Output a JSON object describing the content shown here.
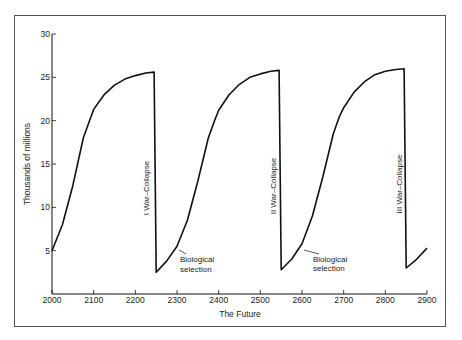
{
  "chart_data": {
    "type": "line",
    "title": "",
    "xlabel": "The Future",
    "ylabel": "Thousands of millions",
    "xlim": [
      2000,
      2900
    ],
    "ylim": [
      0,
      30
    ],
    "x_ticks": [
      2000,
      2100,
      2200,
      2300,
      2400,
      2500,
      2600,
      2700,
      2800,
      2900
    ],
    "y_ticks": [
      5,
      10,
      15,
      20,
      25,
      30
    ],
    "grid": false,
    "legend": null,
    "series": [
      {
        "name": "Population",
        "x": [
          2000,
          2025,
          2050,
          2075,
          2090,
          2100,
          2125,
          2150,
          2175,
          2200,
          2225,
          2245,
          2245,
          2250,
          2275,
          2300,
          2325,
          2350,
          2375,
          2390,
          2400,
          2425,
          2450,
          2475,
          2500,
          2525,
          2545,
          2545,
          2550,
          2575,
          2600,
          2625,
          2650,
          2675,
          2690,
          2700,
          2725,
          2750,
          2775,
          2800,
          2825,
          2845,
          2845,
          2850,
          2875,
          2900
        ],
        "y": [
          5,
          8,
          12.5,
          18,
          20,
          21.3,
          23,
          24.1,
          24.8,
          25.2,
          25.5,
          25.6,
          25.6,
          2.5,
          3.8,
          5.5,
          8.5,
          13,
          18,
          20,
          21.2,
          23,
          24.2,
          25,
          25.4,
          25.7,
          25.8,
          25.8,
          2.8,
          4,
          5.8,
          9,
          13.5,
          18.5,
          20.5,
          21.5,
          23.3,
          24.5,
          25.3,
          25.7,
          25.9,
          26,
          26,
          3,
          4,
          5.3
        ]
      }
    ],
    "annotations": [
      {
        "text": "I  War–Collapse",
        "x": 2245,
        "orientation": "vertical"
      },
      {
        "text": "II  War–Collapse",
        "x": 2545,
        "orientation": "vertical"
      },
      {
        "text": "III  War–Collapse",
        "x": 2845,
        "orientation": "vertical"
      },
      {
        "text": "Biological selection",
        "x": 2300,
        "y": 5.5,
        "arrow": true
      },
      {
        "text": "Biological selection",
        "x": 2600,
        "y": 5.8,
        "arrow": true
      }
    ]
  },
  "labels": {
    "xlabel": "The Future",
    "ylabel": "Thousands of millions",
    "collapse_1": "I  War–Collapse",
    "collapse_2": "II  War–Collapse",
    "collapse_3": "III  War–Collapse",
    "bio_line1": "Biological",
    "bio_line2": "selection"
  }
}
